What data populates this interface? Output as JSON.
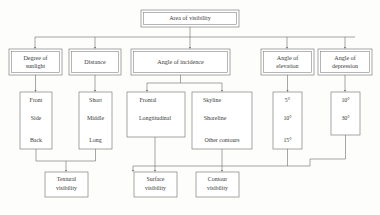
{
  "diagram": {
    "title_node": {
      "label": "Area of visibility"
    },
    "level2": [
      {
        "id": "sunlight",
        "label_line1": "Degree of",
        "label_line2": "sunlight"
      },
      {
        "id": "distance",
        "label_line1": "Distance",
        "label_line2": ""
      },
      {
        "id": "incidence",
        "label_line1": "Angle of incidence",
        "label_line2": ""
      },
      {
        "id": "elevation",
        "label_line1": "Angle of",
        "label_line2": "elevation"
      },
      {
        "id": "depression",
        "label_line1": "Angle of",
        "label_line2": "depression"
      }
    ],
    "level3": [
      {
        "id": "sunlight-values",
        "items": [
          "Front",
          "Side",
          "Back"
        ]
      },
      {
        "id": "distance-values",
        "items": [
          "Short",
          "Middle",
          "Long"
        ]
      },
      {
        "id": "frontal-values",
        "items": [
          "Frontal",
          "Longtitudinal"
        ]
      },
      {
        "id": "skyline-values",
        "items": [
          "Skyline",
          "Shoreline",
          "Other contours"
        ]
      },
      {
        "id": "elevation-values",
        "items": [
          "5°",
          "10°",
          "15°"
        ]
      },
      {
        "id": "depression-values",
        "items": [
          "10°",
          "30°"
        ]
      }
    ],
    "outcomes": [
      {
        "id": "textural",
        "label_line1": "Textural",
        "label_line2": "visibility"
      },
      {
        "id": "surface",
        "label_line1": "Surface",
        "label_line2": "visibility"
      },
      {
        "id": "contour",
        "label_line1": "Contour",
        "label_line2": "visibility"
      }
    ],
    "colors": {
      "line": "#6d6d6d",
      "text": "#3a3a3a",
      "box_fill": "#ffffff",
      "background": "#fdfdfb"
    }
  }
}
